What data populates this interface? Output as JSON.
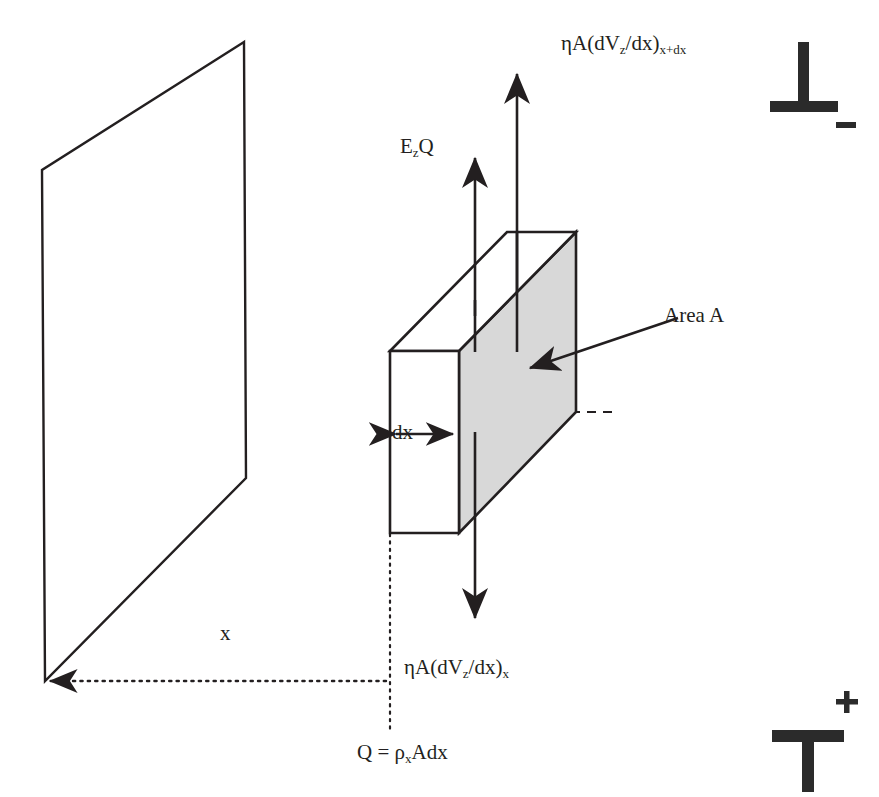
{
  "figure": {
    "type": "physics-schematic",
    "background_color": "#ffffff",
    "ink_color": "#231f20",
    "shaded_face_color": "#d8d8d8"
  },
  "labels": {
    "flux_top": {
      "prefix": "ηA(dV",
      "sub1": "z",
      "mid": "/dx)",
      "sub2": "x+dx"
    },
    "flux_bottom": {
      "prefix": "ηA(dV",
      "sub1": "z",
      "mid": "/dx)",
      "sub2": "x"
    },
    "electric_force": {
      "prefix": "E",
      "sub1": "z",
      "mid": "Q"
    },
    "charge": {
      "prefix": "Q = ρ",
      "sub1": "x",
      "mid": "Adx"
    },
    "thickness": "dx",
    "distance": "x",
    "area": "Area A"
  },
  "electrode_marks": {
    "top_right": {
      "glyph": "⊥",
      "sign": "–",
      "name": "negative-electrode-symbol"
    },
    "bottom_right": {
      "glyph": "T",
      "sign": "+",
      "name": "positive-electrode-symbol"
    }
  },
  "geometry": {
    "wall_plane": {
      "name": "charged-wall-plane",
      "points": "244,42 42,170 45,681 246,478"
    },
    "box": {
      "front_face": "390,351 459,351 459,533 390,533",
      "top_face": "390,351 459,351 576,232 507,232",
      "shaded_right_face": "459,351 576,232 576,412 459,533",
      "hidden_edges": [
        "507,232 507,412",
        "507,412 610,412",
        "390,533 507,412"
      ]
    },
    "arrows": {
      "up_long": {
        "x": 517,
        "from_y": 290,
        "to_y": 72,
        "name": "shear-force-top-arrow"
      },
      "up_short": {
        "x": 475,
        "from_y": 310,
        "to_y": 160,
        "name": "electric-force-arrow"
      },
      "down": {
        "x": 475,
        "from_y": 430,
        "to_y": 620,
        "name": "shear-force-bottom-arrow"
      },
      "dx_double": {
        "y": 434,
        "from_x": 393,
        "to_x": 457,
        "name": "dx-double-arrow"
      },
      "x_double": {
        "y": 681,
        "from_x": 47,
        "to_x": 389,
        "style": "dotted",
        "name": "x-distance-arrow"
      },
      "area_pointer": {
        "from": "676,320",
        "to": "527,369",
        "name": "area-a-pointer"
      }
    },
    "dotted_drop_line": {
      "x": 390,
      "from_y": 533,
      "to_y": 735,
      "name": "projection-drop-line"
    }
  }
}
